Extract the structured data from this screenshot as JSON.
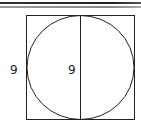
{
  "diagram": {
    "type": "geometry",
    "shapes": {
      "square": {
        "x": 26,
        "y": 15,
        "width": 108,
        "height": 105
      },
      "circle": {
        "cx": 80,
        "cy": 67.5,
        "r": 53
      },
      "diameter_line": {
        "x1": 80,
        "y1": 15,
        "x2": 80,
        "y2": 120
      }
    },
    "labels": {
      "square_side": "9",
      "diameter": "9"
    },
    "colors": {
      "stroke": "#222222",
      "background": "#ffffff"
    }
  }
}
